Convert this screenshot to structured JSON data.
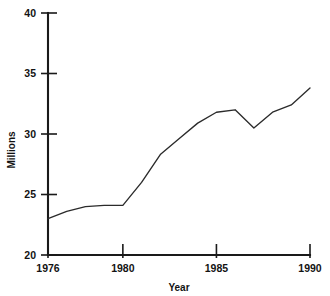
{
  "chart_data": {
    "type": "line",
    "title": "",
    "xlabel": "Year",
    "ylabel": "Millions",
    "x": [
      1976,
      1977,
      1978,
      1979,
      1980,
      1981,
      1982,
      1983,
      1984,
      1985,
      1986,
      1987,
      1988,
      1989,
      1990
    ],
    "values": [
      23.0,
      23.6,
      24.0,
      24.1,
      24.1,
      26.0,
      28.3,
      29.6,
      30.9,
      31.8,
      32.0,
      30.5,
      31.8,
      32.4,
      33.8
    ],
    "series": [
      {
        "name": "Millions",
        "values": [
          23.0,
          23.6,
          24.0,
          24.1,
          24.1,
          26.0,
          28.3,
          29.6,
          30.9,
          31.8,
          32.0,
          30.5,
          31.8,
          32.4,
          33.8
        ]
      }
    ],
    "xlim": [
      1976,
      1990
    ],
    "ylim": [
      20,
      40
    ],
    "ytick_labels": [
      "20",
      "25",
      "30",
      "35",
      "40"
    ],
    "ytick_values": [
      20,
      25,
      30,
      35,
      40
    ],
    "xtick_labels": [
      "1976",
      "1980",
      "1985",
      "1990"
    ],
    "xtick_values": [
      1976,
      1980,
      1985,
      1990
    ],
    "grid": false,
    "legend": false,
    "legend_position": "none",
    "line_color": "#2b2b2b",
    "axis_color": "#1a1a1a",
    "background_color": "#ffffff"
  }
}
